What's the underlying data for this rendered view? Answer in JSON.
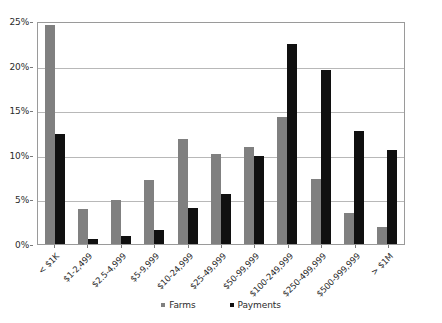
{
  "chart_data": {
    "type": "bar",
    "title": "",
    "subtitle": "",
    "xlabel": "",
    "ylabel": "",
    "ylim": [
      0,
      25
    ],
    "ytick_labels": [
      "0%",
      "5%",
      "10%",
      "15%",
      "20%",
      "25%"
    ],
    "ytick_values": [
      0,
      5,
      10,
      15,
      20,
      25
    ],
    "grid": true,
    "legend_position": "bottom",
    "categories": [
      "< $1K",
      "$1-2,499",
      "$2.5-4,999",
      "$5-9,999",
      "$10-24,999",
      "$25-49,999",
      "$50-99,999",
      "$100-249,999",
      "$250-499,999",
      "$500-999,999",
      "> $1M"
    ],
    "series": [
      {
        "name": "Farms",
        "color": "#808080",
        "values": [
          24.5,
          3.9,
          4.9,
          7.2,
          11.8,
          10.1,
          10.9,
          14.2,
          7.3,
          3.5,
          1.9
        ]
      },
      {
        "name": "Payments",
        "color": "#101010",
        "values": [
          12.3,
          0.6,
          0.9,
          1.6,
          4.0,
          5.6,
          9.9,
          22.4,
          19.5,
          12.7,
          10.5
        ]
      }
    ]
  },
  "legend": {
    "entries": [
      {
        "label": "Farms",
        "color": "#808080"
      },
      {
        "label": "Payments",
        "color": "#101010"
      }
    ]
  },
  "colors": {
    "farms": "#808080",
    "payments": "#101010",
    "gridline": "#b8b8b8",
    "axis": "#9a9a9a",
    "background": "#ffffff",
    "text": "#2b2b2b"
  }
}
